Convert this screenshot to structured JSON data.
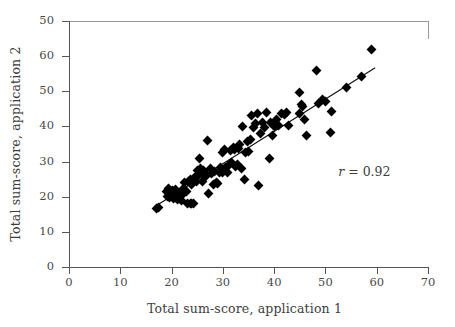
{
  "chart_data": {
    "type": "scatter",
    "title": "",
    "xlabel": "Total sum-score, application 1",
    "ylabel": "Total sum-score, application 2",
    "xlim": [
      0,
      70
    ],
    "ylim": [
      0,
      70
    ],
    "xticks": [
      0,
      10,
      20,
      30,
      40,
      50,
      60,
      70
    ],
    "yticks": [
      0,
      10,
      20,
      30,
      40,
      50,
      60,
      70
    ],
    "ytick_labels": [
      "0",
      "10",
      "20",
      "30",
      "40",
      "50",
      "60",
      "50"
    ],
    "xtick_labels": [
      "0",
      "10",
      "20",
      "30",
      "40",
      "50",
      "60",
      "70"
    ],
    "grid": false,
    "legend": null,
    "marker": "diamond",
    "marker_color": "#000000",
    "annotations": [
      {
        "name": "correlation",
        "symbol": "r",
        "text": " = 0.92",
        "value": 0.92,
        "x": 52.5,
        "y": 27
      }
    ],
    "fit_line": {
      "type": "linear",
      "x_start": 17.0,
      "y_start": 17.4,
      "x_end": 59.7,
      "y_end": 56.7,
      "color": "#111111"
    },
    "points": [
      [
        17.0,
        16.6
      ],
      [
        17.4,
        17.0
      ],
      [
        19.0,
        21.6
      ],
      [
        19.2,
        20.0
      ],
      [
        19.4,
        22.3
      ],
      [
        19.6,
        19.8
      ],
      [
        20.0,
        20.4
      ],
      [
        20.1,
        21.8
      ],
      [
        20.3,
        19.5
      ],
      [
        20.5,
        20.6
      ],
      [
        20.7,
        22.0
      ],
      [
        21.0,
        20.2
      ],
      [
        21.2,
        19.2
      ],
      [
        21.4,
        21.0
      ],
      [
        21.6,
        20.0
      ],
      [
        21.9,
        19.0
      ],
      [
        22.2,
        20.6
      ],
      [
        22.4,
        22.2
      ],
      [
        22.6,
        24.0
      ],
      [
        22.9,
        21.4
      ],
      [
        23.2,
        18.0
      ],
      [
        23.6,
        18.0
      ],
      [
        23.9,
        18.0
      ],
      [
        24.2,
        18.1
      ],
      [
        23.3,
        24.4
      ],
      [
        23.6,
        25.0
      ],
      [
        23.9,
        23.6
      ],
      [
        24.2,
        24.8
      ],
      [
        24.5,
        25.6
      ],
      [
        24.8,
        24.2
      ],
      [
        25.0,
        27.4
      ],
      [
        25.3,
        26.2
      ],
      [
        25.6,
        28.0
      ],
      [
        25.4,
        30.8
      ],
      [
        26.0,
        24.4
      ],
      [
        26.3,
        27.6
      ],
      [
        26.6,
        25.8
      ],
      [
        26.9,
        26.4
      ],
      [
        27.0,
        36.0
      ],
      [
        27.2,
        21.0
      ],
      [
        27.5,
        28.0
      ],
      [
        27.8,
        26.6
      ],
      [
        28.1,
        23.4
      ],
      [
        28.4,
        27.2
      ],
      [
        28.7,
        24.0
      ],
      [
        29.0,
        23.8
      ],
      [
        29.3,
        27.0
      ],
      [
        29.6,
        28.2
      ],
      [
        29.9,
        32.6
      ],
      [
        30.0,
        27.0
      ],
      [
        30.3,
        33.4
      ],
      [
        30.6,
        28.4
      ],
      [
        30.9,
        26.8
      ],
      [
        31.1,
        28.8
      ],
      [
        31.4,
        33.2
      ],
      [
        31.7,
        29.6
      ],
      [
        32.0,
        34.0
      ],
      [
        32.2,
        33.4
      ],
      [
        32.5,
        28.6
      ],
      [
        32.8,
        29.2
      ],
      [
        33.0,
        33.6
      ],
      [
        33.3,
        34.8
      ],
      [
        33.6,
        28.0
      ],
      [
        33.9,
        40.0
      ],
      [
        34.2,
        25.0
      ],
      [
        34.5,
        32.6
      ],
      [
        34.8,
        35.8
      ],
      [
        35.0,
        33.0
      ],
      [
        35.3,
        36.2
      ],
      [
        35.6,
        43.0
      ],
      [
        36.0,
        39.6
      ],
      [
        36.4,
        40.8
      ],
      [
        36.8,
        43.8
      ],
      [
        37.0,
        23.2
      ],
      [
        37.4,
        38.0
      ],
      [
        37.8,
        41.0
      ],
      [
        38.2,
        39.6
      ],
      [
        38.6,
        44.0
      ],
      [
        39.0,
        31.0
      ],
      [
        39.3,
        41.2
      ],
      [
        39.7,
        37.4
      ],
      [
        40.0,
        40.0
      ],
      [
        40.4,
        42.0
      ],
      [
        40.9,
        40.2
      ],
      [
        41.4,
        43.6
      ],
      [
        42.0,
        43.4
      ],
      [
        42.4,
        44.0
      ],
      [
        42.8,
        40.4
      ],
      [
        44.9,
        49.6
      ],
      [
        45.0,
        43.6
      ],
      [
        45.3,
        46.2
      ],
      [
        45.6,
        45.6
      ],
      [
        46.0,
        42.0
      ],
      [
        46.4,
        37.4
      ],
      [
        48.2,
        56.0
      ],
      [
        48.6,
        46.4
      ],
      [
        49.4,
        47.8
      ],
      [
        50.0,
        47.0
      ],
      [
        51.0,
        38.2
      ],
      [
        51.2,
        44.2
      ],
      [
        54.2,
        51.0
      ],
      [
        57.0,
        54.2
      ],
      [
        59.0,
        62.0
      ]
    ]
  },
  "axes": {
    "xlabel": "Total sum-score, application 1",
    "ylabel": "Total sum-score, application 2"
  }
}
